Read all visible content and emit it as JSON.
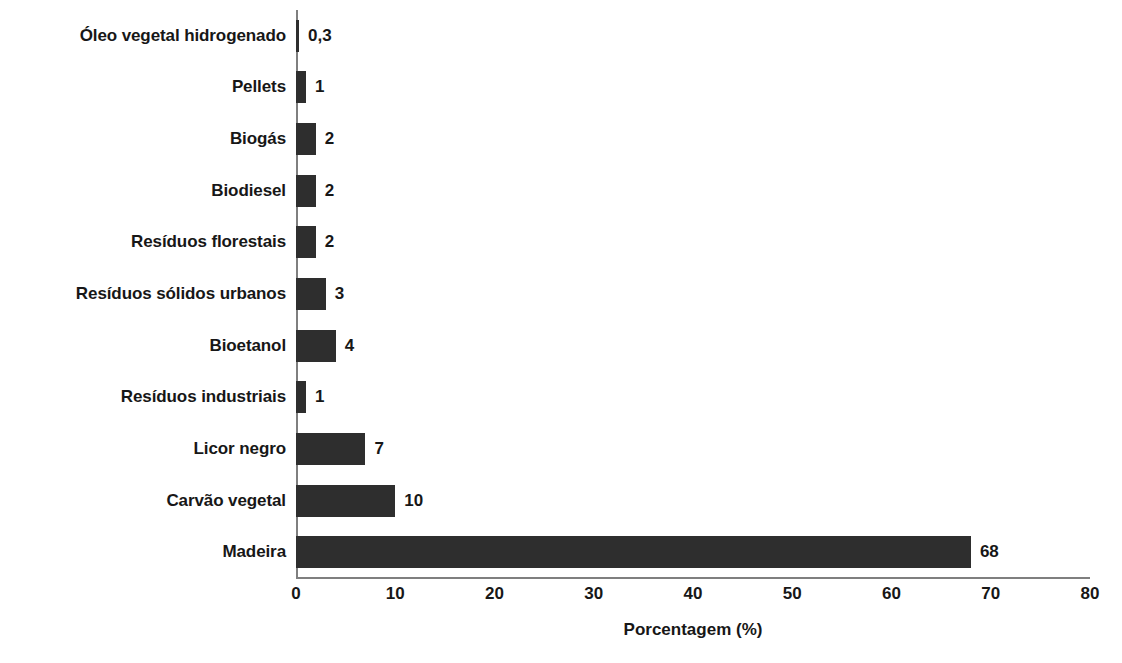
{
  "chart_data": {
    "type": "bar",
    "orientation": "horizontal",
    "title": "",
    "subtitle": "",
    "xlabel": "Porcentagem (%)",
    "ylabel": "",
    "xlim": [
      0,
      80
    ],
    "xticks": [
      0,
      10,
      20,
      30,
      40,
      50,
      60,
      70,
      80
    ],
    "xtick_labels": [
      "0",
      "10",
      "20",
      "30",
      "40",
      "50",
      "60",
      "70",
      "80"
    ],
    "grid": false,
    "legend": false,
    "legend_position": "none",
    "bar_color": "#2e2e2e",
    "axis_color": "#7f7f7f",
    "text_color": "#171717",
    "background_color": "#ffffff",
    "categories": [
      "Óleo vegetal hidrogenado",
      "Pellets",
      "Biogás",
      "Biodiesel",
      "Resíduos florestais",
      "Resíduos sólidos urbanos",
      "Bioetanol",
      "Resíduos industriais",
      "Licor negro",
      "Carvão vegetal",
      "Madeira"
    ],
    "values": [
      0.3,
      1,
      2,
      2,
      2,
      3,
      4,
      1,
      7,
      10,
      68
    ],
    "value_labels": [
      "0,3",
      "1",
      "2",
      "2",
      "2",
      "3",
      "4",
      "1",
      "7",
      "10",
      "68"
    ],
    "bars": [
      {
        "category": "Óleo vegetal hidrogenado",
        "value": 0.3,
        "label": "0,3"
      },
      {
        "category": "Pellets",
        "value": 1,
        "label": "1"
      },
      {
        "category": "Biogás",
        "value": 2,
        "label": "2"
      },
      {
        "category": "Biodiesel",
        "value": 2,
        "label": "2"
      },
      {
        "category": "Resíduos florestais",
        "value": 2,
        "label": "2"
      },
      {
        "category": "Resíduos sólidos urbanos",
        "value": 3,
        "label": "3"
      },
      {
        "category": "Bioetanol",
        "value": 4,
        "label": "4"
      },
      {
        "category": "Resíduos industriais",
        "value": 1,
        "label": "1"
      },
      {
        "category": "Licor negro",
        "value": 7,
        "label": "7"
      },
      {
        "category": "Carvão vegetal",
        "value": 10,
        "label": "10"
      },
      {
        "category": "Madeira",
        "value": 68,
        "label": "68"
      }
    ]
  }
}
